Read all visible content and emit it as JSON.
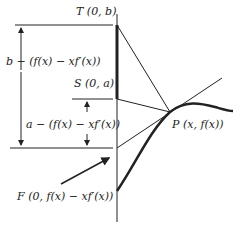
{
  "diagram": {
    "labels": {
      "T": "T (0, b)",
      "S": "S (0, a)",
      "P": "P (x, f(x))",
      "F": "F (0, f(x) − xf′(x))",
      "dist_b": "b − (f(x) − xf′(x))",
      "dist_a": "a − (f(x) − xf′(x))"
    },
    "points": {
      "axis_x": 117,
      "T_y": 25,
      "S_y": 99,
      "F_y": 148,
      "P": [
        170,
        112
      ]
    },
    "colors": {
      "ink": "#222222",
      "background": "#ffffff"
    }
  }
}
